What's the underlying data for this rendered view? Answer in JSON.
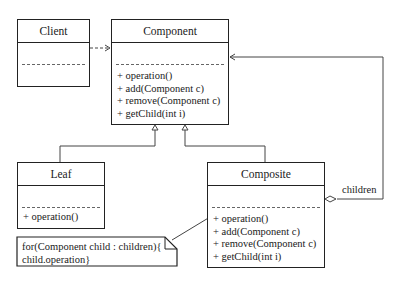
{
  "diagram": {
    "type": "UML class diagram - Composite pattern",
    "classes": {
      "client": {
        "name": "Client",
        "operations": []
      },
      "component": {
        "name": "Component",
        "operations": [
          "+ operation()",
          "+ add(Component c)",
          "+ remove(Component c)",
          "+ getChild(int i)"
        ]
      },
      "leaf": {
        "name": "Leaf",
        "operations": [
          "+ operation()"
        ]
      },
      "composite": {
        "name": "Composite",
        "operations": [
          "+ operation()",
          "+ add(Component c)",
          "+ remove(Component c)",
          "+ getChild(int i)"
        ]
      }
    },
    "note": {
      "line1": "for(Component child : children){",
      "line2": "child.operation}"
    },
    "association_label": "children",
    "relations": [
      {
        "from": "Client",
        "to": "Component",
        "kind": "dependency"
      },
      {
        "from": "Leaf",
        "to": "Component",
        "kind": "generalization"
      },
      {
        "from": "Composite",
        "to": "Component",
        "kind": "generalization"
      },
      {
        "from": "Composite",
        "to": "Component",
        "kind": "aggregation",
        "label": "children"
      },
      {
        "from": "note",
        "to": "Composite.operation",
        "kind": "note-link"
      }
    ]
  }
}
